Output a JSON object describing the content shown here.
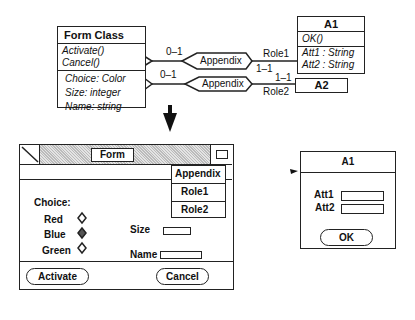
{
  "diagram": {
    "form_class": {
      "title": "Form Class",
      "methods": [
        "Activate()",
        "Cancel()"
      ],
      "attributes": [
        "Choice: Color",
        "Size: integer",
        "Name: string"
      ]
    },
    "a1_class": {
      "title": "A1",
      "methods": [
        "OK()"
      ],
      "attributes": [
        "Att1 : String",
        "Att2 : String"
      ]
    },
    "a2_class": {
      "title": "A2"
    },
    "associations": [
      {
        "label": "Appendix",
        "near_mult": "0–1",
        "far_mult": "1–1",
        "role": "Role1"
      },
      {
        "label": "Appendix",
        "near_mult": "0–1",
        "far_mult": "1–1",
        "role": "Role2"
      }
    ]
  },
  "form_window": {
    "title": "Form",
    "menu": {
      "header": "Appendix",
      "items": [
        "Role1",
        "Role2"
      ]
    },
    "choice_label": "Choice:",
    "radio_options": [
      {
        "label": "Red",
        "selected": false
      },
      {
        "label": "Blue",
        "selected": true
      },
      {
        "label": "Green",
        "selected": false
      }
    ],
    "size_label": "Size",
    "name_label": "Name",
    "activate_button": "Activate",
    "cancel_button": "Cancel"
  },
  "a1_window": {
    "title": "A1",
    "att1_label": "Att1",
    "att2_label": "Att2",
    "ok_button": "OK"
  }
}
